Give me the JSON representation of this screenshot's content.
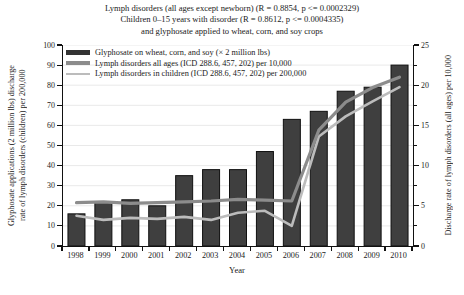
{
  "title": {
    "line1": "Lymph disorders (all ages except newborn) (R = 0.8854, p <= 0.0002329)",
    "line2": "Children 0–15 years with disorder (R = 0.8612, p <= 0.0004335)",
    "line3": "and glyphosate applied to wheat, corn, and soy crops"
  },
  "legend": [
    {
      "label": "Glyphosate on wheat, corn, and soy (× 2 million lbs)",
      "swatch": "bar"
    },
    {
      "label": "Lymph disorders all ages (ICD 288.6, 457, 202) per 10,000",
      "swatch": "thick"
    },
    {
      "label": "Lymph disorders in children (ICD 288.6, 457, 202) per 200,000",
      "swatch": "thin"
    }
  ],
  "axes": {
    "left": {
      "label_line1": "Glyphosate applications (2 million lbs) discharge",
      "label_line2": "rate of lymph disorders (children) per 200,000",
      "ticks": [
        0,
        10,
        20,
        30,
        40,
        50,
        60,
        70,
        80,
        90,
        100
      ],
      "range": [
        0,
        100
      ]
    },
    "right": {
      "label": "Discharge rate of lymph disorders (all ages) per 10,000",
      "ticks": [
        0,
        5,
        10,
        15,
        20,
        25
      ],
      "range": [
        0,
        25
      ]
    },
    "x": {
      "label": "Year",
      "years": [
        "1998",
        "1999",
        "2000",
        "2001",
        "2002",
        "2003",
        "2004",
        "2005",
        "2006",
        "2007",
        "2008",
        "2009",
        "2010"
      ]
    }
  },
  "chart_data": {
    "type": "bar",
    "x": [
      1998,
      1999,
      2000,
      2001,
      2002,
      2003,
      2004,
      2005,
      2006,
      2007,
      2008,
      2009,
      2010
    ],
    "series": [
      {
        "name": "Glyphosate on wheat, corn, and soy (× 2 million lbs)",
        "kind": "bar",
        "axis": "left",
        "values": [
          16,
          22,
          23,
          20,
          35,
          38,
          38,
          47,
          63,
          67,
          77,
          79,
          90
        ]
      },
      {
        "name": "Lymph disorders all ages (ICD 288.6, 457, 202) per 10,000",
        "kind": "line",
        "axis": "right",
        "values": [
          5.4,
          5.5,
          5.3,
          5.4,
          5.5,
          5.6,
          5.8,
          5.7,
          5.6,
          14.4,
          17.9,
          19.7,
          21.0
        ]
      },
      {
        "name": "Lymph disorders in children (ICD 288.6, 457, 202) per 200,000",
        "kind": "line",
        "axis": "left",
        "values": [
          15,
          13,
          14,
          13.5,
          14.5,
          13,
          16.5,
          17.5,
          10,
          54.5,
          64.5,
          72,
          79
        ]
      }
    ],
    "left_ylim": [
      0,
      100
    ],
    "right_ylim": [
      0,
      25
    ],
    "xlabel": "Year",
    "grid": true,
    "legend_position": "top-left"
  },
  "colors": {
    "bar_fill": "#3f3f3f",
    "bar_edge": "#101010",
    "all_ages_line": "#8c8c8c",
    "children_line": "#bcbcbc",
    "grid": "#e7e7e7",
    "axis": "#111111"
  }
}
